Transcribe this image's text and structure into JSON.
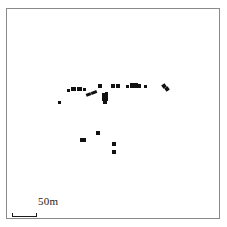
{
  "figure": {
    "type": "archaeological-site-plan",
    "title": "",
    "background_color": "#ffffff",
    "frame": {
      "name": "map-border",
      "color": "#8a8a8a",
      "x": 6,
      "y": 8,
      "width": 214,
      "height": 211
    }
  },
  "scale": {
    "label": "50m",
    "bar_length_px": 24,
    "bar_color": "#1a1a1a",
    "tick_height_px": 4
  },
  "chart_data": {
    "type": "scatter",
    "title": "",
    "xlabel": "",
    "ylabel": "",
    "grid": false,
    "legend": null,
    "units": "meters",
    "scale_bar_meters": 50,
    "scale_bar_pixels": 24,
    "marker_color": "#111111",
    "groups": [
      {
        "name": "west-outlier",
        "features": [
          {
            "x": 57,
            "y": 100,
            "w": 3,
            "h": 3,
            "rot": 0
          }
        ]
      },
      {
        "name": "west-cluster",
        "features": [
          {
            "x": 66,
            "y": 88,
            "w": 3,
            "h": 3,
            "rot": 0
          },
          {
            "x": 70,
            "y": 86,
            "w": 5,
            "h": 4,
            "rot": 0
          },
          {
            "x": 76,
            "y": 86,
            "w": 5,
            "h": 4,
            "rot": 0
          },
          {
            "x": 82,
            "y": 87,
            "w": 3,
            "h": 3,
            "rot": 0
          },
          {
            "x": 85,
            "y": 92,
            "w": 5,
            "h": 3,
            "rot": -22
          },
          {
            "x": 90,
            "y": 90,
            "w": 6,
            "h": 3,
            "rot": -22
          }
        ]
      },
      {
        "name": "central-cluster",
        "features": [
          {
            "x": 97,
            "y": 83,
            "w": 4,
            "h": 4,
            "rot": 0
          },
          {
            "x": 101,
            "y": 92,
            "w": 5,
            "h": 5,
            "rot": 0
          },
          {
            "x": 101,
            "y": 96,
            "w": 6,
            "h": 4,
            "rot": 0
          },
          {
            "x": 102,
            "y": 99,
            "w": 4,
            "h": 4,
            "rot": 0
          },
          {
            "x": 104,
            "y": 91,
            "w": 3,
            "h": 7,
            "rot": 0
          }
        ]
      },
      {
        "name": "east-central-pair",
        "features": [
          {
            "x": 110,
            "y": 83,
            "w": 4,
            "h": 4,
            "rot": 0
          },
          {
            "x": 115,
            "y": 83,
            "w": 4,
            "h": 4,
            "rot": 0
          }
        ]
      },
      {
        "name": "east-cluster",
        "features": [
          {
            "x": 125,
            "y": 84,
            "w": 3,
            "h": 3,
            "rot": 0
          },
          {
            "x": 129,
            "y": 82,
            "w": 4,
            "h": 5,
            "rot": 0
          },
          {
            "x": 133,
            "y": 82,
            "w": 4,
            "h": 5,
            "rot": 0
          },
          {
            "x": 137,
            "y": 83,
            "w": 3,
            "h": 4,
            "rot": 0
          },
          {
            "x": 143,
            "y": 84,
            "w": 3,
            "h": 3,
            "rot": 0
          }
        ]
      },
      {
        "name": "far-east-outlier",
        "features": [
          {
            "x": 161,
            "y": 83,
            "w": 4,
            "h": 4,
            "rot": -35
          },
          {
            "x": 164,
            "y": 86,
            "w": 4,
            "h": 4,
            "rot": -35
          }
        ]
      },
      {
        "name": "south-cluster",
        "features": [
          {
            "x": 79,
            "y": 137,
            "w": 6,
            "h": 4,
            "rot": 0
          },
          {
            "x": 95,
            "y": 130,
            "w": 4,
            "h": 4,
            "rot": 0
          },
          {
            "x": 111,
            "y": 141,
            "w": 4,
            "h": 4,
            "rot": 0
          },
          {
            "x": 111,
            "y": 149,
            "w": 4,
            "h": 4,
            "rot": 0
          }
        ]
      }
    ]
  }
}
